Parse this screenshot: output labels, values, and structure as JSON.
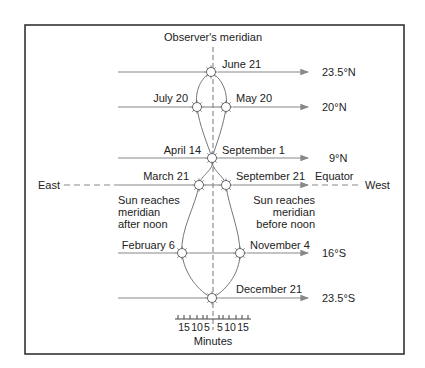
{
  "title": "Observer's meridian",
  "directions": {
    "east": "East",
    "west": "West"
  },
  "latitudes": [
    {
      "label": "23.5°N",
      "y": 72
    },
    {
      "label": "20°N",
      "y": 107
    },
    {
      "label": "9°N",
      "y": 158
    },
    {
      "label": "Equator",
      "y": 185
    },
    {
      "label": "16°S",
      "y": 253
    },
    {
      "label": "23.5°S",
      "y": 298
    }
  ],
  "dates": [
    {
      "label": "June 21",
      "x": 211,
      "y": 72
    },
    {
      "label": "July 20",
      "x": 197,
      "y": 107
    },
    {
      "label": "May 20",
      "x": 226,
      "y": 107
    },
    {
      "label": "April 14",
      "x": 212,
      "y": 158
    },
    {
      "label": "September 1",
      "x": 212,
      "y": 158
    },
    {
      "label": "March 21",
      "x": 199,
      "y": 185
    },
    {
      "label": "September 21",
      "x": 226,
      "y": 185
    },
    {
      "label": "February 6",
      "x": 182,
      "y": 253
    },
    {
      "label": "November 4",
      "x": 240,
      "y": 253
    },
    {
      "label": "December 21",
      "x": 212,
      "y": 298
    }
  ],
  "notes": {
    "left": [
      "Sun reaches",
      "meridian",
      "after noon"
    ],
    "right": [
      "Sun reaches",
      "meridian",
      "before noon"
    ]
  },
  "axis": {
    "ticks_left": [
      "15",
      "10",
      "5"
    ],
    "ticks_right": [
      "5",
      "10",
      "15"
    ],
    "label": "Minutes"
  },
  "colors": {
    "frame": "#333333",
    "line": "#888888",
    "text": "#222222"
  }
}
